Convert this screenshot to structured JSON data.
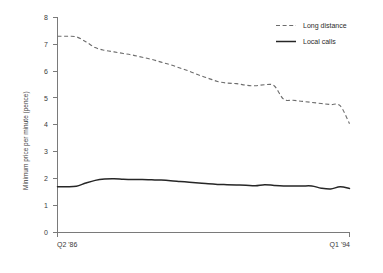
{
  "chart_data": {
    "type": "line",
    "title": "",
    "subtitle": "",
    "xlabel": "",
    "ylabel": "Minimum price per minute (pence)",
    "ylim": [
      0,
      8
    ],
    "grid": false,
    "legend_position": "top-right",
    "y_ticks": [
      0,
      1,
      2,
      3,
      4,
      5,
      6,
      7,
      8
    ],
    "y_tick_labels": [
      "0",
      "1",
      "2",
      "3",
      "4",
      "5",
      "6",
      "7",
      "8"
    ],
    "x_tick_labels": [
      "Q2 '86",
      "Q1 '94"
    ],
    "x_axis_start_label": "Q2 '86",
    "x_axis_end_label": "Q1 '94",
    "x": [
      "Q2 '86",
      "Q3 '86",
      "Q4 '86",
      "Q1 '87",
      "Q2 '87",
      "Q3 '87",
      "Q4 '87",
      "Q1 '88",
      "Q2 '88",
      "Q3 '88",
      "Q4 '88",
      "Q1 '89",
      "Q2 '89",
      "Q3 '89",
      "Q4 '89",
      "Q1 '90",
      "Q2 '90",
      "Q3 '90",
      "Q4 '90",
      "Q1 '91",
      "Q2 '91",
      "Q3 '91",
      "Q4 '91",
      "Q1 '92",
      "Q2 '92",
      "Q3 '92",
      "Q4 '92",
      "Q1 '93",
      "Q2 '93",
      "Q3 '93",
      "Q4 '93",
      "Q1 '94"
    ],
    "series": [
      {
        "name": "Long distance",
        "style": "dashed",
        "color": "#6d6d6d",
        "values": [
          7.3,
          7.3,
          7.28,
          7.1,
          6.88,
          6.78,
          6.72,
          6.66,
          6.6,
          6.52,
          6.44,
          6.34,
          6.24,
          6.12,
          6.0,
          5.86,
          5.74,
          5.62,
          5.56,
          5.54,
          5.48,
          5.46,
          5.5,
          5.46,
          4.96,
          4.92,
          4.88,
          4.84,
          4.8,
          4.76,
          4.72,
          4.05
        ]
      },
      {
        "name": "Local calls",
        "style": "solid",
        "color": "#262626",
        "values": [
          1.7,
          1.7,
          1.72,
          1.84,
          1.94,
          1.99,
          2.0,
          1.98,
          1.97,
          1.97,
          1.96,
          1.95,
          1.93,
          1.9,
          1.87,
          1.84,
          1.81,
          1.79,
          1.78,
          1.77,
          1.76,
          1.74,
          1.78,
          1.75,
          1.73,
          1.73,
          1.73,
          1.73,
          1.65,
          1.62,
          1.7,
          1.64
        ]
      }
    ]
  },
  "legend": {
    "items": [
      {
        "label": "Long distance",
        "style": "dashed"
      },
      {
        "label": "Local calls",
        "style": "solid"
      }
    ]
  },
  "colors": {
    "long_distance": "#6d6d6d",
    "local_calls": "#262626",
    "axis": "#7a7a7a",
    "background": "#ffffff"
  }
}
